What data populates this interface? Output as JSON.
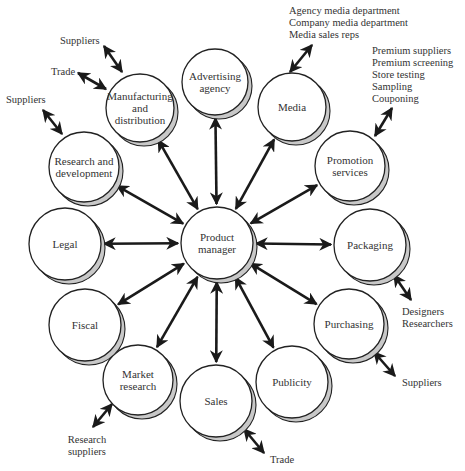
{
  "diagram": {
    "colors": {
      "background": "#ffffff",
      "circle_fill": "#ffffff",
      "circle_stroke": "#222222",
      "shadow_fill": "#c8c8c8",
      "arrow": "#1a1a1a",
      "text": "#333333"
    },
    "center": {
      "id": "product-manager",
      "lines": [
        "Product",
        "manager"
      ],
      "cx": 217,
      "cy": 243,
      "r": 36
    },
    "nodes": [
      {
        "id": "advertising-agency",
        "lines": [
          "Advertising",
          "agency"
        ],
        "cx": 215,
        "cy": 82,
        "r": 33
      },
      {
        "id": "media",
        "lines": [
          "Media"
        ],
        "cx": 292,
        "cy": 107,
        "r": 34
      },
      {
        "id": "promotion-services",
        "lines": [
          "Promotion",
          "services"
        ],
        "cx": 350,
        "cy": 166,
        "r": 35
      },
      {
        "id": "packaging",
        "lines": [
          "Packaging"
        ],
        "cx": 370,
        "cy": 245,
        "r": 36
      },
      {
        "id": "purchasing",
        "lines": [
          "Purchasing"
        ],
        "cx": 349,
        "cy": 324,
        "r": 35
      },
      {
        "id": "publicity",
        "lines": [
          "Publicity"
        ],
        "cx": 292,
        "cy": 382,
        "r": 36
      },
      {
        "id": "sales",
        "lines": [
          "Sales"
        ],
        "cx": 216,
        "cy": 401,
        "r": 36
      },
      {
        "id": "market-research",
        "lines": [
          "Market",
          "research"
        ],
        "cx": 138,
        "cy": 380,
        "r": 35
      },
      {
        "id": "fiscal",
        "lines": [
          "Fiscal"
        ],
        "cx": 85,
        "cy": 325,
        "r": 36
      },
      {
        "id": "legal",
        "lines": [
          "Legal"
        ],
        "cx": 65,
        "cy": 244,
        "r": 36
      },
      {
        "id": "research-and-development",
        "lines": [
          "Research and",
          "development"
        ],
        "cx": 84,
        "cy": 167,
        "r": 35
      },
      {
        "id": "manufacturing-and-distribution",
        "lines": [
          "Manufacturing",
          "and",
          "distribution"
        ],
        "cx": 140,
        "cy": 108,
        "r": 34
      }
    ],
    "external": [
      {
        "id": "media-external",
        "lines": [
          "Agency media department",
          "Company media department",
          "Media sales reps"
        ],
        "x": 289,
        "y": 14,
        "anchor": "start",
        "arrow": [
          [
            312,
            45
          ],
          [
            290,
            72
          ]
        ]
      },
      {
        "id": "promotion-external",
        "lines": [
          "Premium suppliers",
          "Premium screening",
          "Store testing",
          "Sampling",
          "Couponing"
        ],
        "x": 372,
        "y": 54,
        "anchor": "start",
        "arrow": [
          [
            392,
            108
          ],
          [
            375,
            136
          ]
        ]
      },
      {
        "id": "packaging-external",
        "lines": [
          "Designers",
          "Researchers"
        ],
        "x": 402,
        "y": 315,
        "anchor": "start",
        "arrow": [
          [
            394,
            275
          ],
          [
            411,
            300
          ]
        ]
      },
      {
        "id": "purchasing-external",
        "lines": [
          "Suppliers"
        ],
        "x": 402,
        "y": 386,
        "anchor": "start",
        "arrow": [
          [
            374,
            352
          ],
          [
            395,
            376
          ]
        ]
      },
      {
        "id": "sales-external",
        "lines": [
          "Trade"
        ],
        "x": 270,
        "y": 463,
        "anchor": "start",
        "arrow": [
          [
            244,
            429
          ],
          [
            264,
            453
          ]
        ]
      },
      {
        "id": "market-research-external",
        "lines": [
          "Research",
          "suppliers"
        ],
        "x": 87,
        "y": 443,
        "anchor": "middle",
        "arrow": [
          [
            112,
            404
          ],
          [
            93,
            427
          ]
        ]
      },
      {
        "id": "rd-external",
        "lines": [
          "Suppliers"
        ],
        "x": 6,
        "y": 103,
        "anchor": "start",
        "arrow": [
          [
            43,
            110
          ],
          [
            62,
            134
          ]
        ]
      },
      {
        "id": "manufacturing-trade",
        "lines": [
          "Trade"
        ],
        "x": 51,
        "y": 75,
        "anchor": "start",
        "arrow": [
          [
            78,
            73
          ],
          [
            106,
            89
          ]
        ]
      },
      {
        "id": "manufacturing-suppliers",
        "lines": [
          "Suppliers"
        ],
        "x": 60,
        "y": 44,
        "anchor": "start",
        "arrow": [
          [
            104,
            46
          ],
          [
            122,
            72
          ]
        ]
      }
    ]
  }
}
